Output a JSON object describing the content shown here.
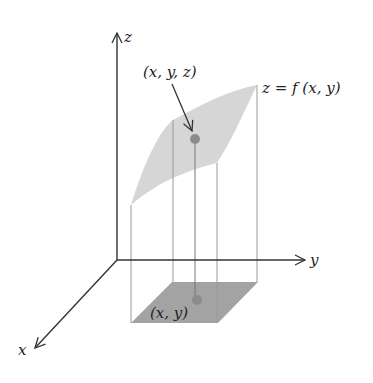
{
  "diagram": {
    "axes": {
      "x_label": "x",
      "y_label": "y",
      "z_label": "z"
    },
    "labels": {
      "surface_point": "(x, y, z)",
      "function": "z = f (x, y)",
      "domain_point": "(x, y)"
    },
    "colors": {
      "axis": "#333333",
      "surface_fill": "#d6d6d6",
      "domain_fill": "#a3a3a3",
      "dot": "#8c8c8c",
      "guide_lines": "#9a9a9a",
      "background": "#ffffff"
    }
  }
}
